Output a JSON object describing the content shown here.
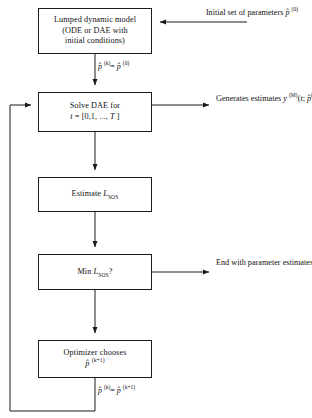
{
  "diagram": {
    "line_color": "#1a1a1a",
    "background": "#ffffff"
  },
  "nodes": [
    {
      "id": "model",
      "name": "lumped-dynamic-model-box",
      "lines": [
        "Lumped dynamic model",
        "(ODE or DAE with",
        "initial conditions)"
      ]
    },
    {
      "id": "solve",
      "name": "solve-dae-box",
      "lines": [
        "Solve DAE for",
        "t = [0,1, ..., T ]"
      ]
    },
    {
      "id": "estimate",
      "name": "estimate-lsos-box",
      "lines": [
        "Estimate L_SOS"
      ]
    },
    {
      "id": "min",
      "name": "min-lsos-decision-box",
      "lines": [
        "Min L_SOS ?"
      ]
    },
    {
      "id": "optimizer",
      "name": "optimizer-chooses-box",
      "lines": [
        "Optimizer chooses",
        "p̂ (k+1)"
      ]
    }
  ],
  "annotations": {
    "initial_parameters": {
      "line1": "Initial set of",
      "line2": "parameters",
      "line3": "p̂ (0)"
    },
    "generates_estimates": {
      "line1": "Generates estimates",
      "line2": "y (M)(t; p̂ (k))"
    },
    "end_with_parameters": {
      "line1": "End with parameter",
      "line2": "estimates p̂ (k)"
    }
  },
  "edge_labels": {
    "init_assignment": "p̂ (k) = p̂ (0)",
    "loop_assignment": "p̂ (k) = p̂ (k+1)"
  },
  "symbols": {
    "p_hat": "p̂",
    "superscript_k": "(k)",
    "superscript_0": "(0)",
    "superscript_k1": "(k+1)",
    "superscript_M": "(M)",
    "subscript_sos": "SOS",
    "L": "L",
    "t_range": "t = [0,1, ..., T ]"
  }
}
